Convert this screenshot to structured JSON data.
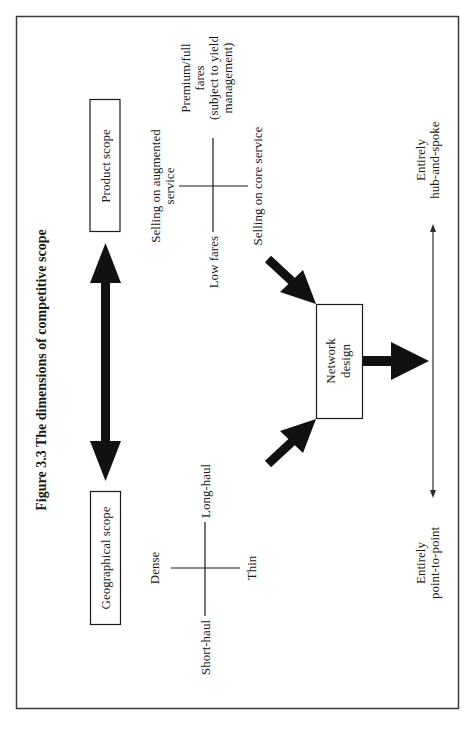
{
  "figure": {
    "title": "Figure 3.3 The dimensions of competitive scope",
    "orientation": "rotated 90° counter-clockwise"
  },
  "boxes": {
    "product_scope": "Product scope",
    "geographical_scope": "Geographical scope",
    "network_design_line1": "Network",
    "network_design_line2": "design"
  },
  "product_axes": {
    "left": "Low fares",
    "right_line1": "Premium/full",
    "right_line2": "fares",
    "right_line3": "(subject to yield",
    "right_line4": "management)",
    "top_line1": "Selling on augmented",
    "top_line2": "service",
    "bottom": "Selling on core service"
  },
  "geographical_axes": {
    "left": "Short-haul",
    "right": "Long-haul",
    "top": "Dense",
    "bottom": "Thin"
  },
  "network_spectrum": {
    "left_line1": "Entirely",
    "left_line2": "point-to-point",
    "right_line1": "Entirely",
    "right_line2": "hub-and-spoke"
  },
  "colors": {
    "ink": "#1a1a1a",
    "frame": "#3a3a3a",
    "background": "#ffffff"
  }
}
